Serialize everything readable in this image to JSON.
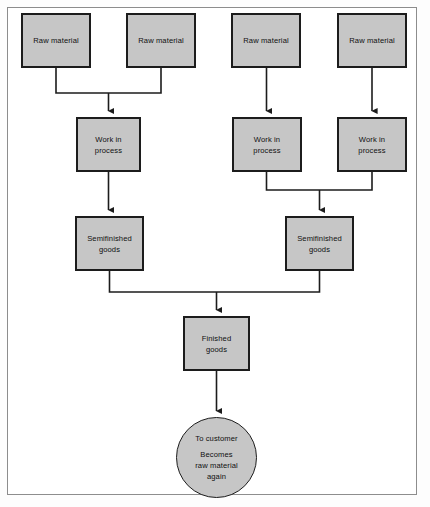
{
  "diagram": {
    "type": "flowchart",
    "colors": {
      "node_fill": "#c6c6c6",
      "node_stroke": "#1c1c1c",
      "frame_stroke": "#8d8d8d",
      "background": "#ffffff",
      "text": "#101010"
    },
    "nodes": [
      {
        "id": "raw1",
        "label": "Raw material",
        "shape": "rect",
        "x": 21,
        "y": 13,
        "w": 70,
        "h": 55
      },
      {
        "id": "raw2",
        "label": "Raw material",
        "shape": "rect",
        "x": 126,
        "y": 13,
        "w": 70,
        "h": 55
      },
      {
        "id": "raw3",
        "label": "Raw material",
        "shape": "rect",
        "x": 231,
        "y": 13,
        "w": 70,
        "h": 55
      },
      {
        "id": "raw4",
        "label": "Raw material",
        "shape": "rect",
        "x": 337,
        "y": 13,
        "w": 70,
        "h": 55
      },
      {
        "id": "wip1",
        "label_line1": "Work in",
        "label_line2": "process",
        "shape": "rect",
        "x": 76,
        "y": 117,
        "w": 65,
        "h": 55
      },
      {
        "id": "wip2",
        "label_line1": "Work in",
        "label_line2": "process",
        "shape": "rect",
        "x": 232,
        "y": 117,
        "w": 70,
        "h": 55
      },
      {
        "id": "wip3",
        "label_line1": "Work in",
        "label_line2": "process",
        "shape": "rect",
        "x": 337,
        "y": 117,
        "w": 70,
        "h": 55
      },
      {
        "id": "semi1",
        "label_line1": "Semifinished",
        "label_line2": "goods",
        "shape": "rect",
        "x": 75,
        "y": 216,
        "w": 69,
        "h": 55
      },
      {
        "id": "semi2",
        "label_line1": "Semifinished",
        "label_line2": "goods",
        "shape": "rect",
        "x": 285,
        "y": 216,
        "w": 69,
        "h": 55
      },
      {
        "id": "finished",
        "label_line1": "Finished",
        "label_line2": "goods",
        "shape": "rect",
        "x": 183,
        "y": 316,
        "w": 67,
        "h": 55
      },
      {
        "id": "customer",
        "label_line1": "To customer",
        "label_line2": "Becomes",
        "label_line3": "raw material",
        "label_line4": "again",
        "shape": "circle",
        "x": 176,
        "y": 417,
        "w": 81,
        "h": 81
      }
    ],
    "edges": [
      {
        "from": "raw1",
        "to": "wip1",
        "style": "elbow-merge"
      },
      {
        "from": "raw2",
        "to": "wip1",
        "style": "elbow-merge"
      },
      {
        "from": "raw3",
        "to": "wip2",
        "style": "straight"
      },
      {
        "from": "raw4",
        "to": "wip3",
        "style": "straight"
      },
      {
        "from": "wip1",
        "to": "semi1",
        "style": "straight"
      },
      {
        "from": "wip2",
        "to": "semi2",
        "style": "elbow-merge"
      },
      {
        "from": "wip3",
        "to": "semi2",
        "style": "elbow-merge"
      },
      {
        "from": "semi1",
        "to": "finished",
        "style": "elbow-merge"
      },
      {
        "from": "semi2",
        "to": "finished",
        "style": "elbow-merge"
      },
      {
        "from": "finished",
        "to": "customer",
        "style": "straight"
      }
    ]
  }
}
